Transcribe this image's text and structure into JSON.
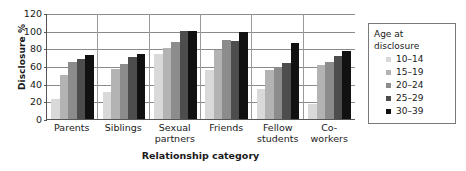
{
  "chart_data": {
    "type": "bar",
    "title": "",
    "xlabel": "Relationship category",
    "ylabel": "Disclosure %",
    "ylim": [
      0,
      120
    ],
    "yticks": [
      120,
      100,
      80,
      60,
      40,
      20,
      0
    ],
    "grid": true,
    "legend_position": "right",
    "legend_title": "Age at disclosure",
    "categories": [
      "Parents",
      "Siblings",
      "Sexual partners",
      "Friends",
      "Fellow students",
      "Co-workers"
    ],
    "series": [
      {
        "name": "10–14",
        "color": "#d9d9d9",
        "values": [
          23,
          31,
          74,
          55,
          34,
          17
        ]
      },
      {
        "name": "15–19",
        "color": "#b3b3b3",
        "values": [
          50,
          57,
          80,
          78,
          56,
          61
        ]
      },
      {
        "name": "20–24",
        "color": "#8c8c8c",
        "values": [
          65,
          62,
          87,
          89,
          59,
          64
        ]
      },
      {
        "name": "25–29",
        "color": "#4d4d4d",
        "values": [
          68,
          70,
          100,
          88,
          63,
          71
        ]
      },
      {
        "name": "30–39",
        "color": "#111111",
        "values": [
          73,
          74,
          100,
          99,
          86,
          77
        ]
      }
    ]
  },
  "legend": {
    "title": "Age at disclosure",
    "items": [
      {
        "label": "10–14",
        "color": "#d9d9d9"
      },
      {
        "label": "15–19",
        "color": "#b3b3b3"
      },
      {
        "label": "20–24",
        "color": "#8c8c8c"
      },
      {
        "label": "25–29",
        "color": "#4d4d4d"
      },
      {
        "label": "30–39",
        "color": "#111111"
      }
    ]
  }
}
